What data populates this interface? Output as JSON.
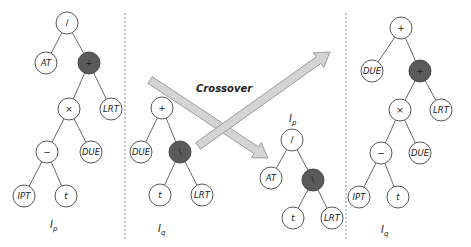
{
  "title": "Crossover",
  "colors": {
    "node_fill": "#ffffff",
    "node_stroke": "#444444",
    "highlight_fill": "#5a5a5a",
    "edge": "#444444",
    "arrow_fill": "#d4d4d4",
    "arrow_stroke": "#8a8a8a",
    "divider": "#888888"
  },
  "trees": [
    {
      "id": "parent-p",
      "label": {
        "main": "I",
        "sub": "p",
        "x": 50,
        "y": 228
      },
      "nodes": [
        {
          "id": "p1",
          "text": "/",
          "x": 67,
          "y": 23,
          "op": true
        },
        {
          "id": "p2",
          "text": "AT",
          "x": 46,
          "y": 63
        },
        {
          "id": "p3",
          "text": "+",
          "x": 89,
          "y": 63,
          "op": true,
          "highlight": true
        },
        {
          "id": "p4",
          "text": "×",
          "x": 69,
          "y": 109,
          "op": true
        },
        {
          "id": "p5",
          "text": "LRT",
          "x": 111,
          "y": 109
        },
        {
          "id": "p6",
          "text": "−",
          "x": 47,
          "y": 152,
          "op": true
        },
        {
          "id": "p7",
          "text": "DUE",
          "x": 91,
          "y": 152
        },
        {
          "id": "p8",
          "text": "IPT",
          "x": 24,
          "y": 196
        },
        {
          "id": "p9",
          "text": "t",
          "x": 66,
          "y": 196
        }
      ],
      "edges": [
        [
          "p1",
          "p2"
        ],
        [
          "p1",
          "p3"
        ],
        [
          "p3",
          "p4"
        ],
        [
          "p3",
          "p5"
        ],
        [
          "p4",
          "p6"
        ],
        [
          "p4",
          "p7"
        ],
        [
          "p6",
          "p8"
        ],
        [
          "p6",
          "p9"
        ]
      ]
    },
    {
      "id": "parent-q",
      "label": {
        "main": "I",
        "sub": "q",
        "x": 158,
        "y": 232
      },
      "nodes": [
        {
          "id": "q1",
          "text": "+",
          "x": 162,
          "y": 108,
          "op": true
        },
        {
          "id": "q2",
          "text": "DUE",
          "x": 141,
          "y": 152
        },
        {
          "id": "q3",
          "text": "\\",
          "x": 180,
          "y": 152,
          "op": true,
          "highlight": true
        },
        {
          "id": "q4",
          "text": "t",
          "x": 160,
          "y": 195
        },
        {
          "id": "q5",
          "text": "LRT",
          "x": 202,
          "y": 195
        }
      ],
      "edges": [
        [
          "q1",
          "q2"
        ],
        [
          "q1",
          "q3"
        ],
        [
          "q3",
          "q4"
        ],
        [
          "q3",
          "q5"
        ]
      ]
    },
    {
      "id": "offspring-p",
      "label": {
        "main": "I",
        "sub": "p",
        "x": 289,
        "y": 122
      },
      "nodes": [
        {
          "id": "r1",
          "text": "/",
          "x": 292,
          "y": 140,
          "op": true
        },
        {
          "id": "r2",
          "text": "AT",
          "x": 271,
          "y": 178
        },
        {
          "id": "r3",
          "text": "\\",
          "x": 313,
          "y": 180,
          "op": true,
          "highlight": true
        },
        {
          "id": "r4",
          "text": "t",
          "x": 293,
          "y": 218
        },
        {
          "id": "r5",
          "text": "LRT",
          "x": 332,
          "y": 218
        }
      ],
      "edges": [
        [
          "r1",
          "r2"
        ],
        [
          "r1",
          "r3"
        ],
        [
          "r3",
          "r4"
        ],
        [
          "r3",
          "r5"
        ]
      ]
    },
    {
      "id": "offspring-q",
      "label": {
        "main": "I",
        "sub": "q",
        "x": 381,
        "y": 233
      },
      "nodes": [
        {
          "id": "s1",
          "text": "+",
          "x": 401,
          "y": 28,
          "op": true
        },
        {
          "id": "s2",
          "text": "DUE",
          "x": 372,
          "y": 71
        },
        {
          "id": "s3",
          "text": "+",
          "x": 420,
          "y": 71,
          "op": true,
          "highlight": true
        },
        {
          "id": "s4",
          "text": "×",
          "x": 400,
          "y": 110,
          "op": true
        },
        {
          "id": "s5",
          "text": "LRT",
          "x": 441,
          "y": 110
        },
        {
          "id": "s6",
          "text": "−",
          "x": 381,
          "y": 153,
          "op": true
        },
        {
          "id": "s7",
          "text": "DUE",
          "x": 420,
          "y": 153
        },
        {
          "id": "s8",
          "text": "IPT",
          "x": 359,
          "y": 197
        },
        {
          "id": "s9",
          "text": "t",
          "x": 398,
          "y": 197
        }
      ],
      "edges": [
        [
          "s1",
          "s2"
        ],
        [
          "s1",
          "s3"
        ],
        [
          "s3",
          "s4"
        ],
        [
          "s3",
          "s5"
        ],
        [
          "s4",
          "s6"
        ],
        [
          "s4",
          "s7"
        ],
        [
          "s6",
          "s8"
        ],
        [
          "s6",
          "s9"
        ]
      ]
    }
  ],
  "dividers": [
    {
      "x": 125,
      "y1": 13,
      "y2": 240
    },
    {
      "x": 346,
      "y1": 13,
      "y2": 240
    }
  ],
  "arrows": [
    {
      "id": "arrow-down",
      "from": [
        150,
        80
      ],
      "to": [
        268,
        158
      ]
    },
    {
      "id": "arrow-up",
      "from": [
        198,
        146
      ],
      "to": [
        330,
        52
      ]
    }
  ],
  "crossover_label": {
    "text": "Crossover",
    "x": 196,
    "y": 92
  }
}
